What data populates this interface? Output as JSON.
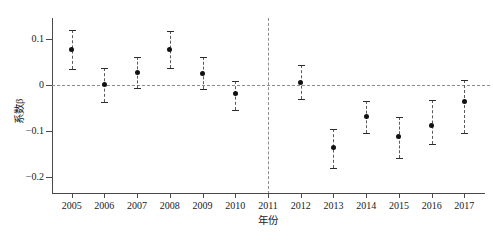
{
  "chart_data": {
    "type": "scatter",
    "title": "",
    "subtitle": "",
    "xlabel": "年份",
    "ylabel": "系数β",
    "categories": [
      "2005",
      "2006",
      "2007",
      "2008",
      "2009",
      "2010",
      "2011",
      "2012",
      "2013",
      "2014",
      "2015",
      "2016",
      "2017"
    ],
    "x": [
      2005,
      2006,
      2007,
      2008,
      2009,
      2010,
      2011,
      2012,
      2013,
      2014,
      2015,
      2016,
      2017
    ],
    "values": [
      0.076,
      0.0,
      0.027,
      0.077,
      0.025,
      -0.019,
      null,
      0.006,
      -0.136,
      -0.068,
      -0.113,
      -0.088,
      -0.036
    ],
    "ci_low": [
      0.034,
      -0.037,
      -0.006,
      0.037,
      -0.01,
      -0.054,
      null,
      -0.031,
      -0.18,
      -0.105,
      -0.158,
      -0.128,
      -0.104
    ],
    "ci_high": [
      0.119,
      0.037,
      0.06,
      0.116,
      0.06,
      0.009,
      null,
      0.044,
      -0.097,
      -0.035,
      -0.07,
      -0.032,
      0.01
    ],
    "xlim": [
      2004.4,
      2017.6
    ],
    "ylim": [
      -0.235,
      0.145
    ],
    "yticks": [
      0.1,
      0,
      -0.1,
      -0.2
    ],
    "ytick_labels": [
      "0.1",
      "0",
      "−0.1",
      "−0.2"
    ],
    "xticks": [
      2005,
      2006,
      2007,
      2008,
      2009,
      2010,
      2011,
      2012,
      2013,
      2014,
      2015,
      2016,
      2017
    ],
    "xtick_labels": [
      "2005",
      "2006",
      "2007",
      "2008",
      "2009",
      "2010",
      "2011",
      "2012",
      "2013",
      "2014",
      "2015",
      "2016",
      "2017"
    ],
    "grid": false,
    "legend": null,
    "reference_lines": [
      {
        "name": "zero-line",
        "orientation": "horizontal",
        "value": 0,
        "style": "dashed",
        "color": "#8c8c8c"
      },
      {
        "name": "policy-line",
        "orientation": "vertical",
        "value": 2011,
        "style": "dashed",
        "color": "#8c8c8c"
      }
    ],
    "marker": {
      "shape": "circle",
      "color": "#111111",
      "size": 5
    },
    "errorbar": {
      "style": "dashed",
      "color": "#5a5a5a",
      "cap": true
    }
  },
  "colors": {
    "axis": "#4a4a4a",
    "marker": "#111111",
    "errorbar": "#5a5a5a",
    "reference": "#8c8c8c",
    "background": "#ffffff",
    "text": "#1a1a1a"
  }
}
